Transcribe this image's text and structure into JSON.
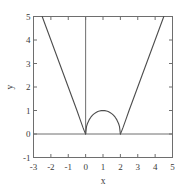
{
  "chart_data": {
    "type": "line",
    "title": "",
    "xlabel": "x",
    "ylabel": "y",
    "xlim": [
      -3,
      5
    ],
    "ylim": [
      -1,
      5
    ],
    "grid": false,
    "legend": null,
    "xticks": [
      -3,
      -2,
      -1,
      0,
      1,
      2,
      3,
      4,
      5
    ],
    "xtick_labels": [
      "-3",
      "-2",
      "-1",
      "0",
      "1",
      "2",
      "3",
      "4",
      "5"
    ],
    "yticks": [
      -1,
      0,
      1,
      2,
      3,
      4,
      5
    ],
    "ytick_labels": [
      "-1",
      "0",
      "1",
      "2",
      "3",
      "4",
      "5"
    ],
    "line_color": "#4d4d4d",
    "axis_color": "#6e6e6e",
    "series": [
      {
        "name": "left-branch",
        "comment": "steep descending branch meeting x-axis at x=0",
        "points": [
          [
            -2.5,
            5.0
          ],
          [
            -2.25,
            4.5
          ],
          [
            -2.0,
            4.0
          ],
          [
            -1.75,
            3.5
          ],
          [
            -1.5,
            3.0
          ],
          [
            -1.25,
            2.5
          ],
          [
            -1.0,
            2.0
          ],
          [
            -0.75,
            1.5
          ],
          [
            -0.5,
            1.0
          ],
          [
            -0.3,
            0.58
          ],
          [
            -0.15,
            0.27
          ],
          [
            -0.05,
            0.08
          ],
          [
            0.0,
            0.0
          ]
        ]
      },
      {
        "name": "dome-arc",
        "comment": "semicircular arc from (0,0) to (2,0) with peak (1,1)",
        "points": [
          [
            0.0,
            0.0
          ],
          [
            0.05,
            0.312
          ],
          [
            0.1,
            0.436
          ],
          [
            0.2,
            0.6
          ],
          [
            0.3,
            0.714
          ],
          [
            0.4,
            0.8
          ],
          [
            0.5,
            0.866
          ],
          [
            0.6,
            0.917
          ],
          [
            0.7,
            0.954
          ],
          [
            0.8,
            0.98
          ],
          [
            0.9,
            0.995
          ],
          [
            1.0,
            1.0
          ],
          [
            1.1,
            0.995
          ],
          [
            1.2,
            0.98
          ],
          [
            1.3,
            0.954
          ],
          [
            1.4,
            0.917
          ],
          [
            1.5,
            0.866
          ],
          [
            1.6,
            0.8
          ],
          [
            1.7,
            0.714
          ],
          [
            1.8,
            0.6
          ],
          [
            1.9,
            0.436
          ],
          [
            1.95,
            0.312
          ],
          [
            2.0,
            0.0
          ]
        ]
      },
      {
        "name": "right-branch",
        "comment": "steep ascending branch leaving x-axis at x=2",
        "points": [
          [
            2.0,
            0.0
          ],
          [
            2.05,
            0.08
          ],
          [
            2.15,
            0.27
          ],
          [
            2.3,
            0.58
          ],
          [
            2.5,
            1.0
          ],
          [
            2.75,
            1.5
          ],
          [
            3.0,
            2.0
          ],
          [
            3.25,
            2.5
          ],
          [
            3.5,
            3.0
          ],
          [
            3.75,
            3.5
          ],
          [
            4.0,
            4.0
          ],
          [
            4.25,
            4.5
          ],
          [
            4.5,
            5.0
          ]
        ]
      },
      {
        "name": "zero-horizontal-line",
        "comment": "horizontal reference line at y=0 across full x range",
        "points": [
          [
            -3,
            0
          ],
          [
            5,
            0
          ]
        ]
      },
      {
        "name": "zero-vertical-line",
        "comment": "vertical reference line at x=0 from y=0 up to y=5",
        "points": [
          [
            0,
            0
          ],
          [
            0,
            5
          ]
        ]
      }
    ]
  }
}
